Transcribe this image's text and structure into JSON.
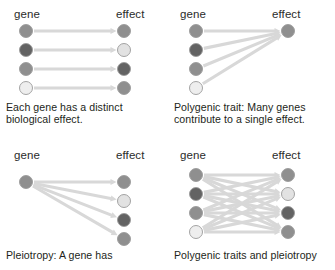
{
  "figure": {
    "background_color": "#ffffff",
    "width": 335,
    "height": 270,
    "arrow_color": "#d8d8d8",
    "node_stroke_color": "#9a9a9a"
  },
  "labels": {
    "gene": "gene",
    "effect": "effect"
  },
  "colors": {
    "medium_gray": "#8f8f8f",
    "dark_gray": "#636363",
    "light_gray": "#e2e2e2",
    "very_light_gray": "#eeeeee",
    "text": "#231f20"
  },
  "panels": [
    {
      "id": "distinct-effects",
      "position": "top-left",
      "caption": "Each gene has a distinct\nbiological effect.",
      "genes": [
        {
          "index": 0,
          "color": "#8f8f8f"
        },
        {
          "index": 1,
          "color": "#636363"
        },
        {
          "index": 2,
          "color": "#8f8f8f"
        },
        {
          "index": 3,
          "color": "#eeeeee"
        }
      ],
      "effects": [
        {
          "index": 0,
          "color": "#8f8f8f"
        },
        {
          "index": 1,
          "color": "#e2e2e2"
        },
        {
          "index": 2,
          "color": "#636363"
        },
        {
          "index": 3,
          "color": "#8f8f8f"
        }
      ],
      "edges": [
        [
          0,
          0
        ],
        [
          1,
          1
        ],
        [
          2,
          2
        ],
        [
          3,
          3
        ]
      ]
    },
    {
      "id": "polygenic-trait",
      "position": "top-right",
      "caption": "Polygenic trait: Many genes\ncontribute to a single effect.",
      "genes": [
        {
          "index": 0,
          "color": "#8f8f8f"
        },
        {
          "index": 1,
          "color": "#636363"
        },
        {
          "index": 2,
          "color": "#8f8f8f"
        },
        {
          "index": 3,
          "color": "#eeeeee"
        }
      ],
      "effects": [
        {
          "index": 0,
          "color": "#8f8f8f"
        }
      ],
      "edges": [
        [
          0,
          0
        ],
        [
          1,
          0
        ],
        [
          2,
          0
        ],
        [
          3,
          0
        ]
      ]
    },
    {
      "id": "pleiotropy",
      "position": "bottom-left",
      "caption": "Pleiotropy: A gene has",
      "genes": [
        {
          "index": 0,
          "color": "#8f8f8f"
        }
      ],
      "effects": [
        {
          "index": 0,
          "color": "#8f8f8f"
        },
        {
          "index": 1,
          "color": "#e2e2e2"
        },
        {
          "index": 2,
          "color": "#636363"
        },
        {
          "index": 3,
          "color": "#8f8f8f"
        }
      ],
      "edges": [
        [
          0,
          0
        ],
        [
          0,
          1
        ],
        [
          0,
          2
        ],
        [
          0,
          3
        ]
      ]
    },
    {
      "id": "polygenic-and-pleiotropy",
      "position": "bottom-right",
      "caption": "Polygenic traits and pleiotropy",
      "genes": [
        {
          "index": 0,
          "color": "#8f8f8f"
        },
        {
          "index": 1,
          "color": "#636363"
        },
        {
          "index": 2,
          "color": "#8f8f8f"
        },
        {
          "index": 3,
          "color": "#eeeeee"
        }
      ],
      "effects": [
        {
          "index": 0,
          "color": "#8f8f8f"
        },
        {
          "index": 1,
          "color": "#e2e2e2"
        },
        {
          "index": 2,
          "color": "#636363"
        },
        {
          "index": 3,
          "color": "#8f8f8f"
        }
      ],
      "edges": [
        [
          0,
          0
        ],
        [
          0,
          1
        ],
        [
          0,
          2
        ],
        [
          0,
          3
        ],
        [
          1,
          0
        ],
        [
          1,
          1
        ],
        [
          1,
          2
        ],
        [
          1,
          3
        ],
        [
          2,
          0
        ],
        [
          2,
          1
        ],
        [
          2,
          2
        ],
        [
          2,
          3
        ],
        [
          3,
          0
        ],
        [
          3,
          1
        ],
        [
          3,
          2
        ],
        [
          3,
          3
        ]
      ]
    }
  ]
}
